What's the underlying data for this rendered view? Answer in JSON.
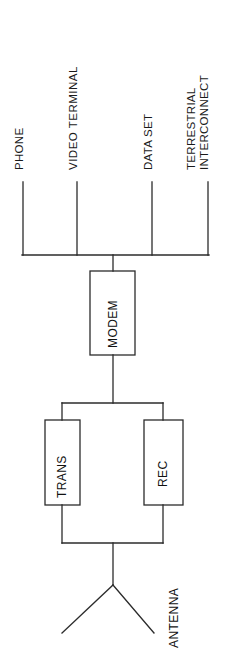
{
  "diagram": {
    "orientation": "rotated-90-ccw",
    "stroke_color": "#2b2b2b",
    "text_color": "#111111",
    "background_color": "#ffffff",
    "terminal_labels": [
      {
        "id": "phone",
        "text": "PHONE"
      },
      {
        "id": "video-terminal",
        "text": "VIDEO  TERMINAL"
      },
      {
        "id": "data-set",
        "text": "DATA SET"
      },
      {
        "id": "terrestrial",
        "text": "TERRESTRIAL"
      },
      {
        "id": "interconnect",
        "text": "INTERCONNECT"
      }
    ],
    "blocks": [
      {
        "id": "modem",
        "text": "MODEM"
      },
      {
        "id": "trans",
        "text": "TRANS"
      },
      {
        "id": "rec",
        "text": "REC"
      }
    ],
    "antenna": {
      "id": "antenna",
      "text": "ANTENNA"
    }
  }
}
